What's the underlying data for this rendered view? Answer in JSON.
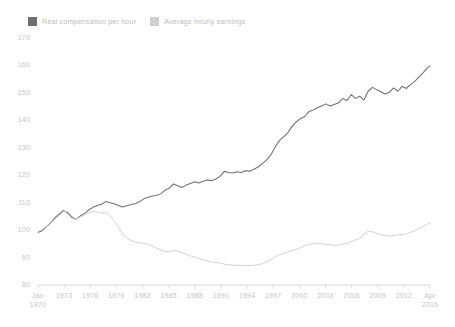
{
  "legend": {
    "position": "top-left",
    "items": [
      {
        "label": "Real compensation per hour",
        "color": "#6f6f6f",
        "swatch": "legend-swatch-dark"
      },
      {
        "label": "Average hourly earnings",
        "color": "#d0d0d0",
        "swatch": "legend-swatch-light"
      }
    ]
  },
  "chart_data": {
    "type": "line",
    "title": "",
    "subtitle": "",
    "xlabel": "",
    "ylabel": "",
    "grid": false,
    "legend_position": "top-left",
    "index_note": "Index, 1970 = 100",
    "ylim": [
      80,
      170
    ],
    "yticks": [
      80,
      90,
      100,
      110,
      120,
      130,
      140,
      150,
      160,
      170
    ],
    "ytick_labels": [
      "80",
      "90",
      "100",
      "110",
      "120",
      "130",
      "140",
      "150",
      "160",
      "170"
    ],
    "xlim": [
      "Jan 1970",
      "Apr 2016"
    ],
    "xticks": [
      "Jan 1970",
      "1973",
      "1976",
      "1979",
      "1982",
      "1985",
      "1988",
      "1991",
      "1994",
      "1997",
      "2000",
      "2003",
      "2006",
      "2009",
      "2012",
      "Apr 2016"
    ],
    "xtick_labels": [
      {
        "line1": "Jan",
        "line2": "1970"
      },
      {
        "line1": "1973",
        "line2": ""
      },
      {
        "line1": "1976",
        "line2": ""
      },
      {
        "line1": "1979",
        "line2": ""
      },
      {
        "line1": "1982",
        "line2": ""
      },
      {
        "line1": "1985",
        "line2": ""
      },
      {
        "line1": "1988",
        "line2": ""
      },
      {
        "line1": "1991",
        "line2": ""
      },
      {
        "line1": "1994",
        "line2": ""
      },
      {
        "line1": "1997",
        "line2": ""
      },
      {
        "line1": "2000",
        "line2": ""
      },
      {
        "line1": "2003",
        "line2": ""
      },
      {
        "line1": "2006",
        "line2": ""
      },
      {
        "line1": "2009",
        "line2": ""
      },
      {
        "line1": "2012",
        "line2": ""
      },
      {
        "line1": "Apr",
        "line2": "2016"
      }
    ],
    "x": [
      1970.0,
      1970.5,
      1971.0,
      1971.5,
      1972.0,
      1972.5,
      1973.0,
      1973.5,
      1974.0,
      1974.5,
      1975.0,
      1975.5,
      1976.0,
      1976.5,
      1977.0,
      1977.5,
      1978.0,
      1978.5,
      1979.0,
      1979.5,
      1980.0,
      1980.5,
      1981.0,
      1981.5,
      1982.0,
      1982.5,
      1983.0,
      1983.5,
      1984.0,
      1984.5,
      1985.0,
      1985.5,
      1986.0,
      1986.5,
      1987.0,
      1987.5,
      1988.0,
      1988.5,
      1989.0,
      1989.5,
      1990.0,
      1990.5,
      1991.0,
      1991.5,
      1992.0,
      1992.5,
      1993.0,
      1993.5,
      1994.0,
      1994.5,
      1995.0,
      1995.5,
      1996.0,
      1996.5,
      1997.0,
      1997.5,
      1998.0,
      1998.5,
      1999.0,
      1999.5,
      2000.0,
      2000.5,
      2001.0,
      2001.5,
      2002.0,
      2002.5,
      2003.0,
      2003.5,
      2004.0,
      2004.5,
      2005.0,
      2005.5,
      2006.0,
      2006.5,
      2007.0,
      2007.5,
      2008.0,
      2008.5,
      2009.0,
      2009.5,
      2010.0,
      2010.5,
      2011.0,
      2011.5,
      2012.0,
      2012.5,
      2013.0,
      2013.5,
      2014.0,
      2014.5,
      2015.0,
      2015.5,
      2016.0,
      2016.3
    ],
    "series": [
      {
        "name": "Real compensation per hour",
        "color": "#6f6f6f",
        "values": [
          99.2,
          99.8,
          101.3,
          102.6,
          104.5,
          105.8,
          107.2,
          106.3,
          104.6,
          104.0,
          105.2,
          106.0,
          107.4,
          108.3,
          109.0,
          109.4,
          110.4,
          110.0,
          109.6,
          109.0,
          108.4,
          108.9,
          109.3,
          109.6,
          110.4,
          111.4,
          112.0,
          112.4,
          112.6,
          113.2,
          114.5,
          115.3,
          116.8,
          116.2,
          115.5,
          116.4,
          117.0,
          117.6,
          117.2,
          117.8,
          118.3,
          118.0,
          118.6,
          119.6,
          121.4,
          121.0,
          120.8,
          121.3,
          121.0,
          121.6,
          121.5,
          122.2,
          123.0,
          124.2,
          125.6,
          127.4,
          130.2,
          132.6,
          134.0,
          135.4,
          137.8,
          139.4,
          140.6,
          141.4,
          143.2,
          143.8,
          144.6,
          145.2,
          146.0,
          145.2,
          145.8,
          146.4,
          148.0,
          147.2,
          149.4,
          148.0,
          148.8,
          147.4,
          150.6,
          152.0,
          151.2,
          150.4,
          149.6,
          150.2,
          151.8,
          150.6,
          152.4,
          151.6,
          153.0,
          154.2,
          155.8,
          157.4,
          159.2,
          159.8
        ]
      },
      {
        "name": "Average hourly earnings",
        "color": "#d0d0d0",
        "values": [
          99.5,
          100.2,
          101.4,
          102.4,
          104.0,
          105.2,
          106.6,
          106.8,
          105.2,
          104.0,
          104.8,
          105.4,
          106.4,
          106.8,
          106.6,
          106.2,
          106.4,
          105.4,
          103.4,
          101.2,
          98.6,
          97.2,
          96.2,
          95.6,
          95.4,
          95.2,
          94.8,
          94.2,
          93.4,
          92.8,
          92.2,
          92.0,
          92.6,
          92.4,
          91.8,
          91.2,
          90.6,
          90.2,
          89.6,
          89.2,
          88.8,
          88.4,
          88.2,
          88.0,
          87.6,
          87.4,
          87.2,
          87.2,
          87.0,
          87.2,
          87.0,
          87.2,
          87.4,
          87.8,
          88.4,
          89.2,
          90.2,
          91.0,
          91.6,
          92.0,
          92.6,
          93.0,
          93.6,
          94.2,
          94.8,
          95.0,
          95.2,
          95.0,
          94.8,
          94.6,
          94.4,
          94.6,
          95.0,
          95.2,
          95.8,
          96.4,
          97.0,
          98.6,
          99.6,
          99.4,
          98.8,
          98.4,
          98.0,
          97.8,
          98.0,
          98.2,
          98.4,
          98.6,
          99.2,
          99.8,
          100.6,
          101.4,
          102.2,
          102.6
        ]
      }
    ]
  }
}
